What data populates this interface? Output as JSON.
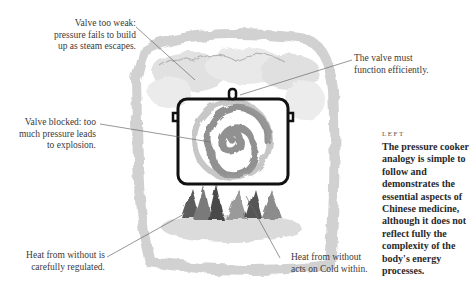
{
  "illustration": {
    "subject": "pressure-cooker-analogy",
    "colors": {
      "ink": "#111111",
      "wash": "#9a9a9a",
      "leader": "#6a6a6a"
    }
  },
  "labels": {
    "valve_too_weak": [
      "Valve too weak:",
      "pressure fails to build",
      "up as steam escapes."
    ],
    "valve_must": [
      "The valve must",
      "function efficiently."
    ],
    "valve_blocked": [
      "Valve blocked: too",
      "much pressure leads",
      "to explosion."
    ],
    "heat_regulated": [
      "Heat from without is",
      "carefully regulated."
    ],
    "heat_acts": [
      "Heat from without",
      "acts on Cold within."
    ]
  },
  "caption": {
    "tag": "LEFT",
    "body": "The pressure cooker analogy is simple to follow and demonstrates the essential aspects of Chinese medicine, although it does not reflect fully the complexity of the body's energy processes."
  }
}
